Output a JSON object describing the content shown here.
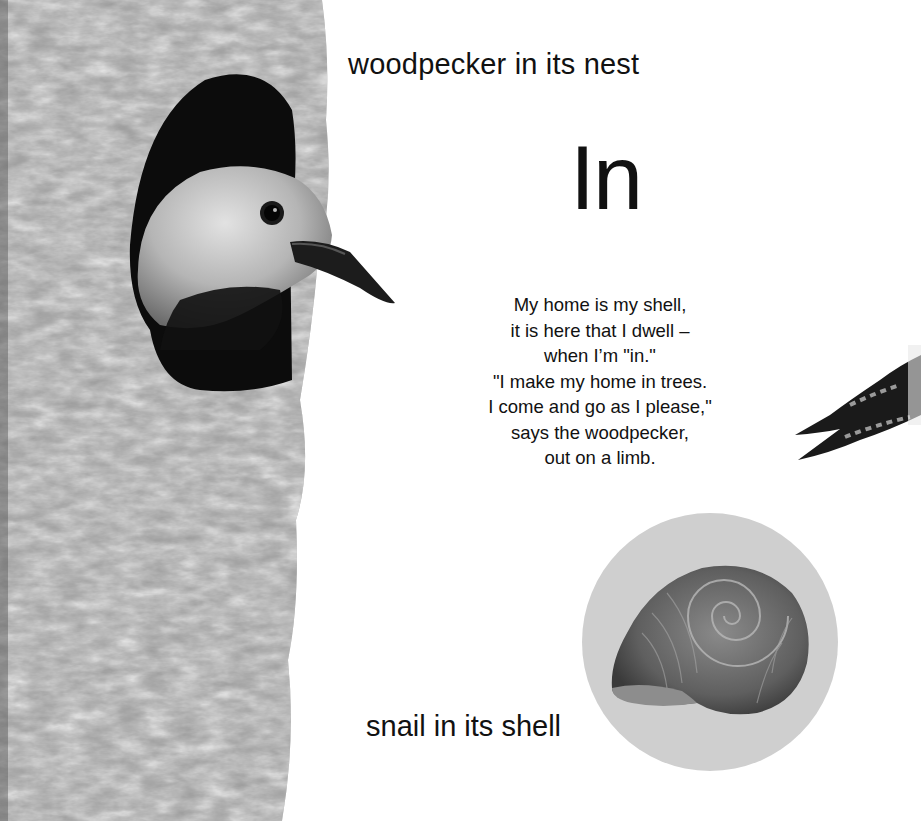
{
  "page": {
    "background": "#ffffff",
    "text_color": "#111111"
  },
  "captions": {
    "top": "woodpecker in its nest",
    "bottom": "snail in its shell"
  },
  "heading": {
    "word": "In"
  },
  "poem": {
    "lines": [
      "My home is my shell,",
      "it is here that I dwell –",
      "when I’m \"in.\"",
      "\"I make my home in trees.",
      "I come and go as I please,\"",
      "says the woodpecker,",
      "out on a limb."
    ]
  },
  "images": {
    "tree": {
      "label": "tree-trunk-with-nest-hole"
    },
    "woodpecker": {
      "label": "woodpecker-head-in-hole"
    },
    "beak_partial": {
      "label": "partial-woodpecker-beak"
    },
    "snail_shell": {
      "label": "snail-shell-in-circle",
      "circle_color": "#cfcfcf"
    }
  }
}
